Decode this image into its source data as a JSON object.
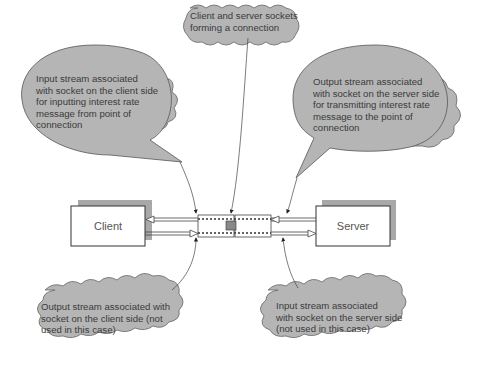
{
  "diagram": {
    "nodes": {
      "client": {
        "label": "Client"
      },
      "server": {
        "label": "Server"
      }
    },
    "callouts": {
      "top_center": "Client and server sockets\nforming a connection",
      "top_left": "Input stream associated\nwith socket on the client side\nfor inputting interest rate\nmessage from point of\nconnection",
      "top_right": "Output stream associated\nwith socket on the server side\nfor transmitting interest rate\nmessage to the point of\nconnection",
      "bottom_left": "Output stream associated with\nsocket on the client side (not\nused in this case)",
      "bottom_right": "Input stream associated\nwith socket on the server side\n(not used in this case)"
    },
    "colors": {
      "callout_fill": "#b5b5b5",
      "shadow": "#a8a8a8",
      "stroke": "#444444"
    }
  }
}
